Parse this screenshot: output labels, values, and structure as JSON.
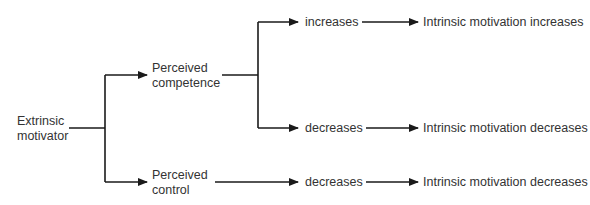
{
  "diagram": {
    "nodes": {
      "extrinsic": {
        "line1": "Extrinsic",
        "line2": "motivator"
      },
      "competence": {
        "line1": "Perceived",
        "line2": "competence"
      },
      "control": {
        "line1": "Perceived",
        "line2": "control"
      },
      "comp_increases": "increases",
      "comp_decreases": "decreases",
      "ctrl_decreases": "decreases",
      "outcome_increase": "Intrinsic motivation increases",
      "outcome_decrease_1": "Intrinsic motivation decreases",
      "outcome_decrease_2": "Intrinsic motivation decreases"
    },
    "edges": [
      {
        "from": "Extrinsic motivator",
        "to": "Perceived competence"
      },
      {
        "from": "Extrinsic motivator",
        "to": "Perceived control"
      },
      {
        "from": "Perceived competence",
        "to": "increases"
      },
      {
        "from": "Perceived competence",
        "to": "decreases"
      },
      {
        "from": "Perceived control",
        "to": "decreases"
      },
      {
        "from": "increases",
        "to": "Intrinsic motivation increases"
      },
      {
        "from": "decreases",
        "to": "Intrinsic motivation decreases"
      },
      {
        "from": "decreases",
        "to": "Intrinsic motivation decreases"
      }
    ],
    "colors": {
      "line": "#1a1a1a",
      "text": "#333333",
      "background": "#ffffff"
    }
  }
}
